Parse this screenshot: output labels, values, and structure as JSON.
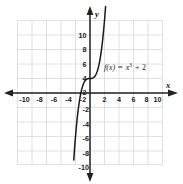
{
  "chart_data": {
    "type": "line",
    "title": "",
    "subtitle": "",
    "xlabel": "x",
    "ylabel": "y",
    "xlim": [
      -11,
      11
    ],
    "ylim": [
      -11,
      11
    ],
    "grid": true,
    "grid_step": 2,
    "legend": "none",
    "annotations": [
      {
        "name": "function-equation",
        "text": "f(x) = x3 + 2",
        "parts": {
          "fx": "f(x)",
          "equals": "=",
          "base": "x",
          "exponent": "3",
          "plus": "+",
          "constant": "2"
        },
        "x": 3.0,
        "y": 4.6
      }
    ],
    "series": [
      {
        "name": "f(x) = x^3 + 2",
        "expression": "x^3 + 2",
        "color": "#1a1a1a",
        "x": [
          -2.24,
          -2.1,
          -2.0,
          -1.9,
          -1.8,
          -1.7,
          -1.6,
          -1.5,
          -1.4,
          -1.3,
          -1.2,
          -1.1,
          -1.0,
          -0.9,
          -0.8,
          -0.7,
          -0.6,
          -0.5,
          -0.4,
          -0.3,
          -0.2,
          -0.1,
          0.0,
          0.1,
          0.2,
          0.3,
          0.4,
          0.5,
          0.6,
          0.7,
          0.8,
          0.9,
          1.0,
          1.1,
          1.2,
          1.3,
          1.4,
          1.5,
          1.6,
          1.7,
          1.8,
          1.9,
          2.0,
          2.1,
          2.15
        ],
        "y": [
          -9.24,
          -7.26,
          -6.0,
          -4.86,
          -3.83,
          -2.91,
          -2.1,
          -1.38,
          -0.74,
          -0.2,
          0.27,
          0.67,
          1.0,
          1.27,
          1.49,
          1.66,
          1.78,
          1.88,
          1.94,
          1.97,
          1.99,
          2.0,
          2.0,
          2.0,
          2.01,
          2.03,
          2.06,
          2.13,
          2.22,
          2.34,
          2.51,
          2.73,
          3.0,
          3.33,
          3.73,
          4.2,
          4.74,
          5.38,
          6.1,
          6.91,
          7.83,
          8.86,
          10.0,
          11.26,
          11.94
        ]
      }
    ],
    "x_ticks": [
      {
        "value": -10,
        "label": "-10"
      },
      {
        "value": -8,
        "label": "-8"
      },
      {
        "value": -6,
        "label": "-6"
      },
      {
        "value": -4,
        "label": "-4"
      },
      {
        "value": -2,
        "label": "-2"
      },
      {
        "value": 2,
        "label": "2"
      },
      {
        "value": 4,
        "label": "4"
      },
      {
        "value": 6,
        "label": "6"
      },
      {
        "value": 8,
        "label": "8"
      },
      {
        "value": 10,
        "label": "10"
      }
    ],
    "y_ticks": [
      {
        "value": 10,
        "label": "10"
      },
      {
        "value": 8,
        "label": "8"
      },
      {
        "value": 6,
        "label": "6"
      },
      {
        "value": 4,
        "label": "4"
      },
      {
        "value": 2,
        "label": "2"
      },
      {
        "value": -2,
        "label": "-2"
      },
      {
        "value": -4,
        "label": "-4"
      },
      {
        "value": -6,
        "label": "-6"
      },
      {
        "value": -8,
        "label": "-8"
      },
      {
        "value": -10,
        "label": "-10"
      }
    ],
    "colors": {
      "grid": "#d8d8d8",
      "axis": "#222222",
      "curve": "#1a1a1a",
      "text": "#1a1a1a",
      "background": "#ffffff"
    }
  },
  "figure": {
    "axis_label_x": "x",
    "axis_label_y": "y"
  }
}
